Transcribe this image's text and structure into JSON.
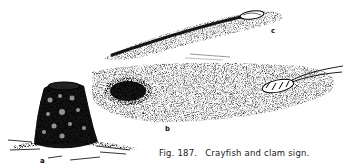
{
  "figure": {
    "caption_prefix": "Fig. 187.",
    "caption_text": "Crayfish and clam sign.",
    "panels": [
      {
        "label": "a",
        "description": "crayfish mud chimney (burrow mound)"
      },
      {
        "label": "b",
        "description": "crayfish burrow hole with crayfish in sediment"
      },
      {
        "label": "c",
        "description": "clam trail furrow with clam at end"
      }
    ]
  }
}
